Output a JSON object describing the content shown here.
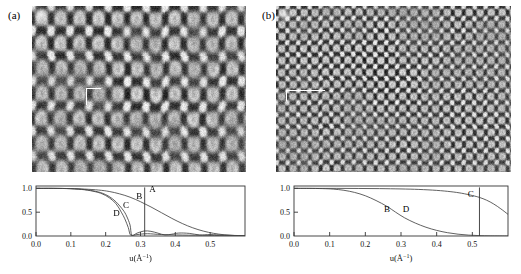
{
  "figure": {
    "panels": [
      {
        "id": "a",
        "label": "(a)",
        "micrograph": {
          "name": "hrtem-lattice-image-coarse",
          "description": "High-resolution TEM lattice image, coarse rectangular fringe pattern",
          "lattice_spacing_px": {
            "x": 19,
            "y": 25
          },
          "contrast": "high",
          "marker": "white L-shaped scale marker"
        }
      },
      {
        "id": "b",
        "label": "(b)",
        "micrograph": {
          "name": "hrtem-lattice-image-fine",
          "description": "High-resolution TEM lattice image, fine square fringe pattern",
          "lattice_spacing_px": {
            "x": 11,
            "y": 12
          },
          "contrast": "high",
          "marker": "white L-shaped scale marker"
        }
      }
    ]
  },
  "chart_data": [
    {
      "type": "line",
      "panel": "a",
      "title": "",
      "xlabel": "u(Å⁻¹)",
      "ylabel": "",
      "xlim": [
        0.0,
        0.6
      ],
      "ylim": [
        0.0,
        1.05
      ],
      "xticks": [
        0.0,
        0.1,
        0.2,
        0.3,
        0.4,
        0.5
      ],
      "xticklabels": [
        "0.0",
        "0.1",
        "0.2",
        "0.3",
        "0.4",
        "0.5"
      ],
      "yticks": [
        0.0,
        0.5,
        1.0
      ],
      "yticklabels": [
        "0.0",
        "0.5",
        "1.0"
      ],
      "grid": false,
      "legend": "inline-labels",
      "annotations": [
        {
          "text": "A",
          "x": 0.325,
          "y": 0.93
        },
        {
          "text": "B",
          "x": 0.288,
          "y": 0.78
        },
        {
          "text": "C",
          "x": 0.25,
          "y": 0.58
        },
        {
          "text": "D",
          "x": 0.222,
          "y": 0.43
        }
      ],
      "vertical_lines": [
        {
          "label": "A",
          "x": 0.312,
          "y_top": 1.02,
          "y_bottom": 0.0
        }
      ],
      "series": [
        {
          "name": "B",
          "label": "B",
          "comment": "broad spatial-coherence envelope, decays to ~0 near u=0.52",
          "x": [
            0.0,
            0.05,
            0.1,
            0.14,
            0.18,
            0.21,
            0.24,
            0.27,
            0.3,
            0.33,
            0.36,
            0.39,
            0.42,
            0.45,
            0.48,
            0.51,
            0.54,
            0.57,
            0.6
          ],
          "values": [
            1.0,
            1.0,
            0.995,
            0.985,
            0.965,
            0.935,
            0.885,
            0.815,
            0.72,
            0.61,
            0.49,
            0.37,
            0.262,
            0.172,
            0.104,
            0.056,
            0.026,
            0.01,
            0.003
          ]
        },
        {
          "name": "C",
          "label": "C",
          "comment": "envelope crossing zero near u=0.275, small oscillating lobes beyond",
          "x": [
            0.0,
            0.05,
            0.1,
            0.14,
            0.17,
            0.19,
            0.21,
            0.23,
            0.25,
            0.26,
            0.27,
            0.275,
            0.29,
            0.31,
            0.33,
            0.35,
            0.37,
            0.39,
            0.41,
            0.44,
            0.47,
            0.5,
            0.54,
            0.6
          ],
          "values": [
            1.0,
            1.0,
            0.995,
            0.975,
            0.94,
            0.9,
            0.83,
            0.715,
            0.545,
            0.42,
            0.23,
            0.02,
            0.06,
            0.105,
            0.098,
            0.06,
            0.022,
            0.038,
            0.062,
            0.055,
            0.022,
            0.03,
            0.018,
            0.006
          ]
        },
        {
          "name": "D",
          "label": "D",
          "comment": "steepest envelope, crosses zero near u=0.268",
          "x": [
            0.0,
            0.05,
            0.1,
            0.14,
            0.17,
            0.19,
            0.21,
            0.23,
            0.245,
            0.255,
            0.265,
            0.272,
            0.29,
            0.32,
            0.36,
            0.42,
            0.5,
            0.6
          ],
          "values": [
            1.0,
            1.0,
            0.993,
            0.97,
            0.93,
            0.885,
            0.805,
            0.675,
            0.5,
            0.36,
            0.175,
            0.015,
            0.03,
            0.048,
            0.03,
            0.02,
            0.012,
            0.004
          ]
        }
      ]
    },
    {
      "type": "line",
      "panel": "b",
      "title": "",
      "xlabel": "u(Å⁻¹)",
      "ylabel": "",
      "xlim": [
        0.0,
        0.6
      ],
      "ylim": [
        0.0,
        1.05
      ],
      "xticks": [
        0.0,
        0.1,
        0.2,
        0.3,
        0.4,
        0.5
      ],
      "xticklabels": [
        "0.0",
        "0.1",
        "0.2",
        "0.3",
        "0.4",
        "0.5"
      ],
      "yticks": [
        0.0,
        0.5,
        1.0
      ],
      "yticklabels": [
        "0.0",
        "0.5",
        "1.0"
      ],
      "grid": false,
      "legend": "inline-labels",
      "annotations": [
        {
          "text": "B",
          "x": 0.252,
          "y": 0.5
        },
        {
          "text": "D",
          "x": 0.305,
          "y": 0.5
        },
        {
          "text": "C",
          "x": 0.487,
          "y": 0.82
        }
      ],
      "vertical_lines": [
        {
          "label": "C",
          "x": 0.52,
          "y_top": 1.02,
          "y_bottom": 0.0
        }
      ],
      "series": [
        {
          "name": "B",
          "label": "B",
          "comment": "sigmoidal decay, 0.5 crossing near u=0.285, near zero by u=0.50",
          "x": [
            0.0,
            0.04,
            0.08,
            0.11,
            0.14,
            0.17,
            0.2,
            0.23,
            0.26,
            0.285,
            0.31,
            0.34,
            0.37,
            0.4,
            0.43,
            0.46,
            0.49,
            0.52,
            0.55,
            0.6
          ],
          "values": [
            1.0,
            1.0,
            0.995,
            0.985,
            0.96,
            0.915,
            0.845,
            0.745,
            0.625,
            0.5,
            0.382,
            0.272,
            0.184,
            0.118,
            0.07,
            0.038,
            0.018,
            0.008,
            0.003,
            0.001
          ]
        },
        {
          "name": "C",
          "label": "C",
          "comment": "very broad envelope staying near 1.0 until u~0.45, then falling",
          "x": [
            0.0,
            0.06,
            0.12,
            0.18,
            0.24,
            0.3,
            0.35,
            0.4,
            0.44,
            0.47,
            0.5,
            0.52,
            0.54,
            0.56,
            0.58,
            0.6
          ],
          "values": [
            1.0,
            1.0,
            1.0,
            0.998,
            0.995,
            0.988,
            0.978,
            0.958,
            0.93,
            0.898,
            0.85,
            0.81,
            0.752,
            0.672,
            0.57,
            0.455
          ]
        }
      ]
    }
  ]
}
